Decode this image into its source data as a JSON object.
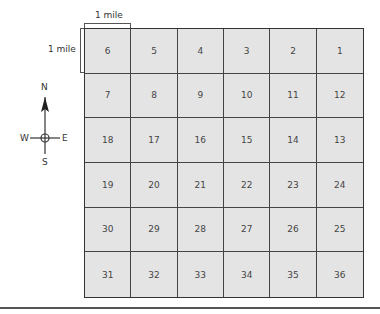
{
  "scale": {
    "horizontal_label": "1 mile",
    "vertical_label": "1 mile"
  },
  "compass": {
    "north": "N",
    "south": "S",
    "east": "E",
    "west": "W"
  },
  "grid": {
    "rows": 6,
    "columns": 6,
    "cells": [
      [
        "6",
        "5",
        "4",
        "3",
        "2",
        "1"
      ],
      [
        "7",
        "8",
        "9",
        "10",
        "11",
        "12"
      ],
      [
        "18",
        "17",
        "16",
        "15",
        "14",
        "13"
      ],
      [
        "19",
        "20",
        "21",
        "22",
        "23",
        "24"
      ],
      [
        "30",
        "29",
        "28",
        "27",
        "26",
        "25"
      ],
      [
        "31",
        "32",
        "33",
        "34",
        "35",
        "36"
      ]
    ],
    "fill_color": "#e4e4e4",
    "line_color": "#444444"
  }
}
